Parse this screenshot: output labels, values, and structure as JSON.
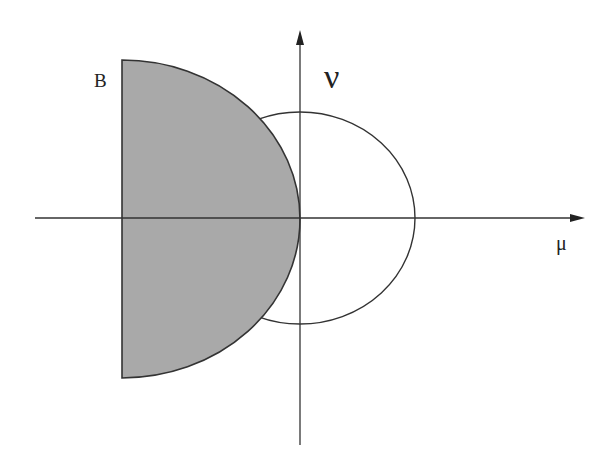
{
  "diagram": {
    "labels": {
      "region": "B",
      "vertical_axis": "ν",
      "horizontal_axis": "μ"
    },
    "colors": {
      "region_fill": "#a9a9a9",
      "stroke": "#333333",
      "background": "#ffffff"
    },
    "elements": [
      {
        "type": "axis",
        "orientation": "horizontal",
        "label": "μ",
        "arrow": "right"
      },
      {
        "type": "axis",
        "orientation": "vertical",
        "label": "ν",
        "arrow": "up"
      },
      {
        "type": "shaded-half-disk",
        "label": "B",
        "side": "left of vertical axis, bounded by vertical line and arc"
      },
      {
        "type": "circle",
        "center": "origin",
        "fill": "none"
      }
    ]
  }
}
